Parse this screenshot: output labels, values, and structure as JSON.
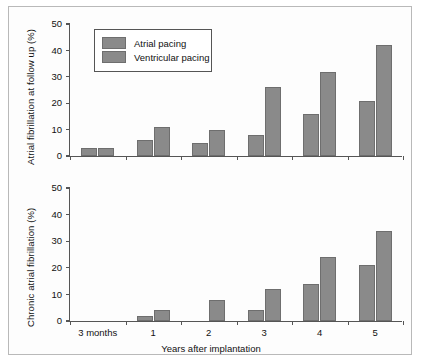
{
  "figure": {
    "border_color": "#b9b9b9",
    "background": "#fdfdfd"
  },
  "legend": {
    "position": "top-left-inside",
    "entries": [
      {
        "label": "Atrial pacing",
        "color": "#8a8a8a"
      },
      {
        "label": "Ventricular pacing",
        "color": "#8a8a8a"
      }
    ]
  },
  "chart_data": [
    {
      "type": "bar",
      "panel": "top",
      "title": "",
      "xlabel": "",
      "ylabel": "Atrial fibrillation at follow up (%)",
      "ylim": [
        0,
        50
      ],
      "yticks": [
        0,
        10,
        20,
        30,
        40,
        50
      ],
      "grid": false,
      "show_xticklabels": false,
      "categories": [
        "3 months",
        "1",
        "2",
        "3",
        "4",
        "5"
      ],
      "series": [
        {
          "name": "Atrial pacing",
          "color": "#8a8a8a",
          "values": [
            3,
            6,
            5,
            8,
            16,
            21
          ]
        },
        {
          "name": "Ventricular pacing",
          "color": "#8a8a8a",
          "values": [
            3,
            11,
            10,
            26,
            32,
            42
          ]
        }
      ]
    },
    {
      "type": "bar",
      "panel": "bottom",
      "title": "",
      "xlabel": "Years after implantation",
      "ylabel": "Chronic atrial fibrillation (%)",
      "ylim": [
        0,
        50
      ],
      "yticks": [
        0,
        10,
        20,
        30,
        40,
        50
      ],
      "grid": false,
      "show_xticklabels": true,
      "categories": [
        "3 months",
        "1",
        "2",
        "3",
        "4",
        "5"
      ],
      "series": [
        {
          "name": "Atrial pacing",
          "color": "#8a8a8a",
          "values": [
            0,
            2,
            0,
            4,
            14,
            21
          ]
        },
        {
          "name": "Ventricular pacing",
          "color": "#8a8a8a",
          "values": [
            0,
            4,
            8,
            12,
            24,
            34
          ]
        }
      ]
    }
  ]
}
